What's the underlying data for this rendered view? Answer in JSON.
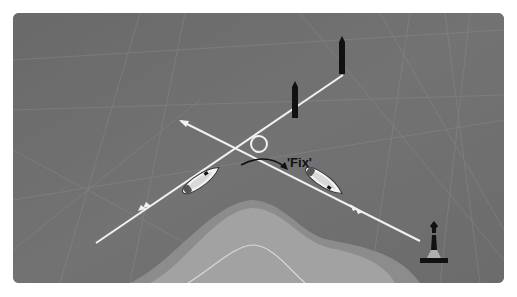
{
  "diagram": {
    "title": "",
    "fix_label": "'Fix'",
    "colors": {
      "sea": "#6e6e6e",
      "sea_dark": "#5f5f5f",
      "grid_lines": "#8a8a8a",
      "land_outer": "#8c8c8c",
      "land_inner": "#a3a3a3",
      "contour": "#d8d8d8",
      "bearing_line": "#f2f2f2",
      "marker": "#111111"
    },
    "elements": [
      {
        "type": "bearing-line",
        "from": [
          96,
          243
        ],
        "to": [
          343,
          75
        ]
      },
      {
        "type": "bearing-line",
        "from": [
          179,
          120
        ],
        "to": [
          420,
          241
        ]
      },
      {
        "type": "fix-circle",
        "center": [
          258,
          143
        ]
      },
      {
        "type": "boat",
        "position": [
          200,
          178
        ],
        "heading": "north-east"
      },
      {
        "type": "boat",
        "position": [
          325,
          180
        ],
        "heading": "south-east"
      },
      {
        "type": "curved-arrow",
        "from": [
          236,
          163
        ],
        "to": [
          290,
          168
        ]
      },
      {
        "type": "cardinal-mark",
        "position": [
          342,
          40
        ]
      },
      {
        "type": "cardinal-mark",
        "position": [
          295,
          96
        ]
      },
      {
        "type": "buoy",
        "position": [
          437,
          240
        ]
      },
      {
        "type": "land-mass",
        "shape": "headland"
      }
    ]
  }
}
